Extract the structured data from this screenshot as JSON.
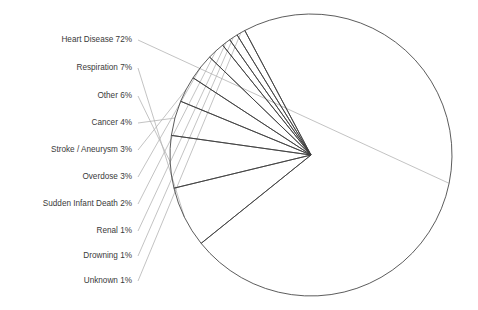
{
  "chart_data": {
    "type": "pie",
    "title": "",
    "xlabel": "",
    "ylabel": "",
    "legend_position": "left-labels-with-leader-lines",
    "grid": false,
    "total_percent": 100,
    "start_angle_deg": -118,
    "direction": "clockwise",
    "center": {
      "x": 311,
      "y": 155
    },
    "radius": 141,
    "fill": "none",
    "slice_stroke": "#3f3f3f",
    "leader_stroke": "#b4b4b4",
    "label_color": "#3a3a3a",
    "background": "#ffffff",
    "categories": [
      "Heart Disease",
      "Respiration",
      "Other",
      "Cancer",
      "Stroke / Aneurysm",
      "Overdose",
      "Sudden Infant Death",
      "Renal",
      "Drowning",
      "Unknown"
    ],
    "values": [
      72,
      7,
      6,
      4,
      3,
      3,
      2,
      1,
      1,
      1
    ],
    "labels": [
      "Heart Disease 72%",
      "Respiration 7%",
      "Other 6%",
      "Cancer 4%",
      "Stroke / Aneurysm 3%",
      "Overdose 3%",
      "Sudden Infant Death 2%",
      "Renal 1%",
      "Drowning 1%",
      "Unknown 1%"
    ],
    "label_anchor_x": 132,
    "label_y_positions": [
      40,
      68,
      96,
      123,
      150,
      177,
      204,
      231,
      256,
      281
    ]
  }
}
